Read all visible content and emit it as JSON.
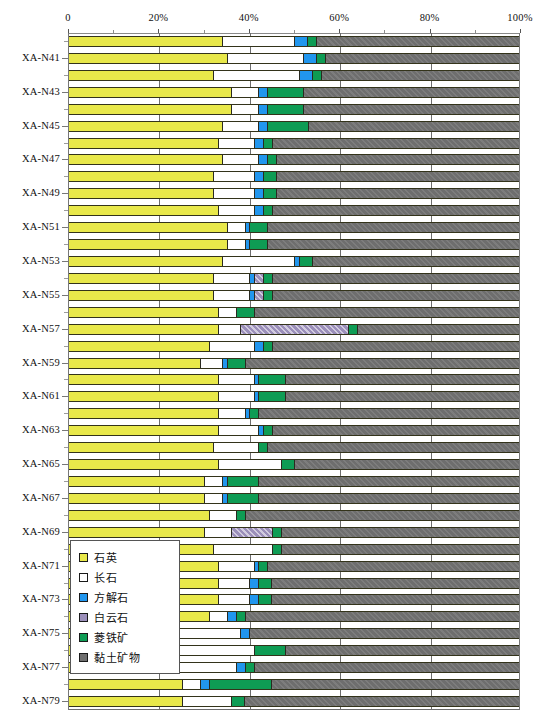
{
  "chart_data": {
    "type": "bar",
    "orientation": "horizontal",
    "stacked": true,
    "normalized_percent": true,
    "title": "",
    "xlabel": "",
    "ylabel": "",
    "xlim": [
      0,
      100
    ],
    "grid": true,
    "legend_position": "inside-lower-left",
    "xticks": [
      {
        "value": 0,
        "label": "0"
      },
      {
        "value": 20,
        "label": "20%"
      },
      {
        "value": 40,
        "label": "40%"
      },
      {
        "value": 60,
        "label": "60%"
      },
      {
        "value": 80,
        "label": "80%"
      },
      {
        "value": 100,
        "label": "100%"
      }
    ],
    "minor_xticks": [
      10,
      30,
      50,
      70,
      90
    ],
    "series": [
      {
        "name": "石英",
        "key": "quartz",
        "color": "#e8e84a"
      },
      {
        "name": "长石",
        "key": "feldspar",
        "color": "#ffffff"
      },
      {
        "name": "方解石",
        "key": "calcite",
        "color": "#2196ee"
      },
      {
        "name": "白云石",
        "key": "dolomite",
        "color": "#9b8fba"
      },
      {
        "name": "菱铁矿",
        "key": "siderite",
        "color": "#0e9c54"
      },
      {
        "name": "黏土矿物",
        "key": "clay",
        "color": "#6e6e6e"
      }
    ],
    "categories": [
      "XA-N40",
      "XA-N41",
      "XA-N42",
      "XA-N43",
      "XA-N44",
      "XA-N45",
      "XA-N46",
      "XA-N47",
      "XA-N48",
      "XA-N49",
      "XA-N50",
      "XA-N51",
      "XA-N52",
      "XA-N53",
      "XA-N54",
      "XA-N55",
      "XA-N56",
      "XA-N57",
      "XA-N58",
      "XA-N59",
      "XA-N60",
      "XA-N61",
      "XA-N62",
      "XA-N63",
      "XA-N64",
      "XA-N65",
      "XA-N66",
      "XA-N67",
      "XA-N68",
      "XA-N69",
      "XA-N70",
      "XA-N71",
      "XA-N72",
      "XA-N73",
      "XA-N74",
      "XA-N75",
      "XA-N76",
      "XA-N77",
      "XA-N78",
      "XA-N79"
    ],
    "labeled_categories": [
      "XA-N41",
      "XA-N43",
      "XA-N45",
      "XA-N47",
      "XA-N49",
      "XA-N51",
      "XA-N53",
      "XA-N55",
      "XA-N57",
      "XA-N59",
      "XA-N61",
      "XA-N63",
      "XA-N65",
      "XA-N67",
      "XA-N69",
      "XA-N71",
      "XA-N73",
      "XA-N75",
      "XA-N77",
      "XA-N79"
    ],
    "rows": [
      {
        "category": "XA-N40",
        "values": {
          "quartz": 34,
          "feldspar": 16,
          "calcite": 3,
          "dolomite": 0,
          "siderite": 2,
          "clay": 45
        }
      },
      {
        "category": "XA-N41",
        "values": {
          "quartz": 35,
          "feldspar": 17,
          "calcite": 3,
          "dolomite": 0,
          "siderite": 2,
          "clay": 43
        }
      },
      {
        "category": "XA-N42",
        "values": {
          "quartz": 32,
          "feldspar": 19,
          "calcite": 3,
          "dolomite": 0,
          "siderite": 2,
          "clay": 44
        }
      },
      {
        "category": "XA-N43",
        "values": {
          "quartz": 36,
          "feldspar": 6,
          "calcite": 2,
          "dolomite": 0,
          "siderite": 8,
          "clay": 48
        }
      },
      {
        "category": "XA-N44",
        "values": {
          "quartz": 36,
          "feldspar": 6,
          "calcite": 2,
          "dolomite": 0,
          "siderite": 8,
          "clay": 48
        }
      },
      {
        "category": "XA-N45",
        "values": {
          "quartz": 34,
          "feldspar": 8,
          "calcite": 2,
          "dolomite": 0,
          "siderite": 9,
          "clay": 47
        }
      },
      {
        "category": "XA-N46",
        "values": {
          "quartz": 33,
          "feldspar": 8,
          "calcite": 2,
          "dolomite": 0,
          "siderite": 2,
          "clay": 55
        }
      },
      {
        "category": "XA-N47",
        "values": {
          "quartz": 34,
          "feldspar": 8,
          "calcite": 2,
          "dolomite": 0,
          "siderite": 2,
          "clay": 54
        }
      },
      {
        "category": "XA-N48",
        "values": {
          "quartz": 32,
          "feldspar": 9,
          "calcite": 2,
          "dolomite": 0,
          "siderite": 3,
          "clay": 54
        }
      },
      {
        "category": "XA-N49",
        "values": {
          "quartz": 32,
          "feldspar": 9,
          "calcite": 2,
          "dolomite": 0,
          "siderite": 3,
          "clay": 54
        }
      },
      {
        "category": "XA-N50",
        "values": {
          "quartz": 33,
          "feldspar": 8,
          "calcite": 2,
          "dolomite": 0,
          "siderite": 2,
          "clay": 55
        }
      },
      {
        "category": "XA-N51",
        "values": {
          "quartz": 35,
          "feldspar": 4,
          "calcite": 1,
          "dolomite": 0,
          "siderite": 4,
          "clay": 56
        }
      },
      {
        "category": "XA-N52",
        "values": {
          "quartz": 35,
          "feldspar": 4,
          "calcite": 1,
          "dolomite": 0,
          "siderite": 4,
          "clay": 56
        }
      },
      {
        "category": "XA-N53",
        "values": {
          "quartz": 34,
          "feldspar": 16,
          "calcite": 1,
          "dolomite": 0,
          "siderite": 3,
          "clay": 46
        }
      },
      {
        "category": "XA-N54",
        "values": {
          "quartz": 32,
          "feldspar": 8,
          "calcite": 1,
          "dolomite": 2,
          "siderite": 2,
          "clay": 55
        }
      },
      {
        "category": "XA-N55",
        "values": {
          "quartz": 32,
          "feldspar": 8,
          "calcite": 1,
          "dolomite": 2,
          "siderite": 2,
          "clay": 55
        }
      },
      {
        "category": "XA-N56",
        "values": {
          "quartz": 33,
          "feldspar": 4,
          "calcite": 0,
          "dolomite": 0,
          "siderite": 4,
          "clay": 59
        }
      },
      {
        "category": "XA-N57",
        "values": {
          "quartz": 33,
          "feldspar": 5,
          "calcite": 0,
          "dolomite": 24,
          "siderite": 2,
          "clay": 36
        }
      },
      {
        "category": "XA-N58",
        "values": {
          "quartz": 31,
          "feldspar": 10,
          "calcite": 2,
          "dolomite": 0,
          "siderite": 2,
          "clay": 55
        }
      },
      {
        "category": "XA-N59",
        "values": {
          "quartz": 29,
          "feldspar": 5,
          "calcite": 1,
          "dolomite": 0,
          "siderite": 4,
          "clay": 61
        }
      },
      {
        "category": "XA-N60",
        "values": {
          "quartz": 33,
          "feldspar": 8,
          "calcite": 1,
          "dolomite": 0,
          "siderite": 6,
          "clay": 52
        }
      },
      {
        "category": "XA-N61",
        "values": {
          "quartz": 33,
          "feldspar": 8,
          "calcite": 1,
          "dolomite": 0,
          "siderite": 6,
          "clay": 52
        }
      },
      {
        "category": "XA-N62",
        "values": {
          "quartz": 33,
          "feldspar": 6,
          "calcite": 1,
          "dolomite": 0,
          "siderite": 2,
          "clay": 58
        }
      },
      {
        "category": "XA-N63",
        "values": {
          "quartz": 33,
          "feldspar": 9,
          "calcite": 1,
          "dolomite": 0,
          "siderite": 2,
          "clay": 55
        }
      },
      {
        "category": "XA-N64",
        "values": {
          "quartz": 32,
          "feldspar": 10,
          "calcite": 0,
          "dolomite": 0,
          "siderite": 2,
          "clay": 56
        }
      },
      {
        "category": "XA-N65",
        "values": {
          "quartz": 33,
          "feldspar": 14,
          "calcite": 0,
          "dolomite": 0,
          "siderite": 3,
          "clay": 50
        }
      },
      {
        "category": "XA-N66",
        "values": {
          "quartz": 30,
          "feldspar": 4,
          "calcite": 1,
          "dolomite": 0,
          "siderite": 7,
          "clay": 58
        }
      },
      {
        "category": "XA-N67",
        "values": {
          "quartz": 30,
          "feldspar": 4,
          "calcite": 1,
          "dolomite": 0,
          "siderite": 7,
          "clay": 58
        }
      },
      {
        "category": "XA-N68",
        "values": {
          "quartz": 31,
          "feldspar": 6,
          "calcite": 0,
          "dolomite": 0,
          "siderite": 2,
          "clay": 61
        }
      },
      {
        "category": "XA-N69",
        "values": {
          "quartz": 30,
          "feldspar": 6,
          "calcite": 0,
          "dolomite": 9,
          "siderite": 2,
          "clay": 53
        }
      },
      {
        "category": "XA-N70",
        "values": {
          "quartz": 32,
          "feldspar": 13,
          "calcite": 0,
          "dolomite": 0,
          "siderite": 2,
          "clay": 53
        }
      },
      {
        "category": "XA-N71",
        "values": {
          "quartz": 33,
          "feldspar": 8,
          "calcite": 1,
          "dolomite": 0,
          "siderite": 2,
          "clay": 56
        }
      },
      {
        "category": "XA-N72",
        "values": {
          "quartz": 33,
          "feldspar": 7,
          "calcite": 2,
          "dolomite": 0,
          "siderite": 3,
          "clay": 55
        }
      },
      {
        "category": "XA-N73",
        "values": {
          "quartz": 33,
          "feldspar": 7,
          "calcite": 2,
          "dolomite": 0,
          "siderite": 3,
          "clay": 55
        }
      },
      {
        "category": "XA-N74",
        "values": {
          "quartz": 31,
          "feldspar": 4,
          "calcite": 2,
          "dolomite": 0,
          "siderite": 2,
          "clay": 61
        }
      },
      {
        "category": "XA-N75",
        "values": {
          "quartz": 20,
          "feldspar": 18,
          "calcite": 2,
          "dolomite": 0,
          "siderite": 0,
          "clay": 60
        }
      },
      {
        "category": "XA-N76",
        "values": {
          "quartz": 24,
          "feldspar": 17,
          "calcite": 0,
          "dolomite": 0,
          "siderite": 7,
          "clay": 52
        }
      },
      {
        "category": "XA-N77",
        "values": {
          "quartz": 21,
          "feldspar": 16,
          "calcite": 2,
          "dolomite": 0,
          "siderite": 2,
          "clay": 59
        }
      },
      {
        "category": "XA-N78",
        "values": {
          "quartz": 25,
          "feldspar": 4,
          "calcite": 2,
          "dolomite": 0,
          "siderite": 14,
          "clay": 55
        }
      },
      {
        "category": "XA-N79",
        "values": {
          "quartz": 25,
          "feldspar": 11,
          "calcite": 0,
          "dolomite": 0,
          "siderite": 3,
          "clay": 61
        }
      }
    ]
  },
  "legend": {
    "items": [
      {
        "label": "石英",
        "key": "quartz"
      },
      {
        "label": "长石",
        "key": "feldspar"
      },
      {
        "label": "方解石",
        "key": "calcite"
      },
      {
        "label": "白云石",
        "key": "dolomite"
      },
      {
        "label": "菱铁矿",
        "key": "siderite"
      },
      {
        "label": "黏土矿物",
        "key": "clay"
      }
    ]
  }
}
